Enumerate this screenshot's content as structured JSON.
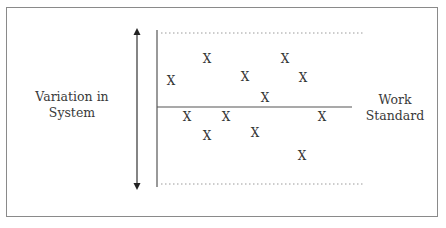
{
  "diagram": {
    "y_axis_label_line1": "Variation in",
    "y_axis_label_line2": "System",
    "reference_label_line1": "Work",
    "reference_label_line2": "Standard",
    "marker_glyph": "X",
    "colors": {
      "line": "#555555",
      "dotted": "#9a9a9a",
      "frame": "#8a8a8a",
      "text": "#333333"
    },
    "points": [
      {
        "x": 171,
        "y": 81
      },
      {
        "x": 207,
        "y": 59
      },
      {
        "x": 245,
        "y": 77
      },
      {
        "x": 265,
        "y": 98
      },
      {
        "x": 285,
        "y": 59
      },
      {
        "x": 303,
        "y": 78
      },
      {
        "x": 187,
        "y": 117
      },
      {
        "x": 226,
        "y": 117
      },
      {
        "x": 207,
        "y": 136
      },
      {
        "x": 255,
        "y": 133
      },
      {
        "x": 322,
        "y": 117
      },
      {
        "x": 302,
        "y": 156
      }
    ]
  }
}
